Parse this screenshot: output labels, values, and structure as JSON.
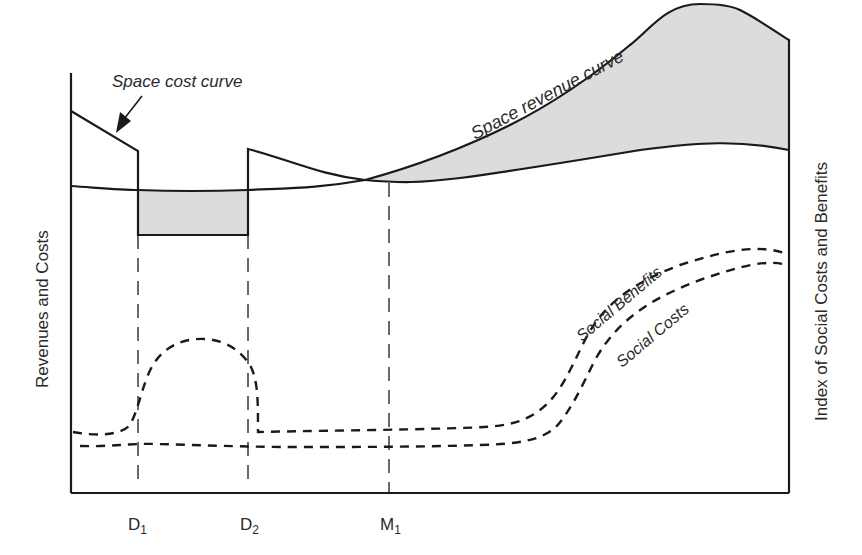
{
  "diagram": {
    "type": "economic-location-diagram",
    "left_axis_label": "Revenues and  Costs",
    "right_axis_label": "Index of Social Costs and Benefits",
    "x_ticks": [
      {
        "main": "D",
        "sub": "1"
      },
      {
        "main": "D",
        "sub": "2"
      },
      {
        "main": "M",
        "sub": "1"
      }
    ],
    "curve_labels": {
      "space_cost": "Space cost curve",
      "space_revenue": "Space revenue curve",
      "social_benefits": "Social Benefits",
      "social_costs": "Social Costs"
    },
    "shaded_regions": [
      "Loss area between D1 and D2 (cost above revenue)",
      "Surplus area beyond M1 (revenue above cost)"
    ],
    "colors": {
      "line": "#1a1a1a",
      "shade": "#dcdcdc",
      "text": "#2a2a2a"
    }
  }
}
